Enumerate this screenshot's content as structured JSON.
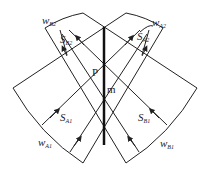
{
  "diagram": {
    "labels": {
      "wB2": {
        "main": "w",
        "sub": "B2"
      },
      "SB2": {
        "main": "S",
        "sub": "B2"
      },
      "wA2": {
        "main": "w",
        "sub": "A2"
      },
      "SA2": {
        "main": "S",
        "sub": "A2"
      },
      "P": "P",
      "m": "m",
      "SA1": {
        "main": "S",
        "sub": "A1"
      },
      "SB1": {
        "main": "S",
        "sub": "B1"
      },
      "wA1": {
        "main": "w",
        "sub": "A1"
      },
      "wB1": {
        "main": "w",
        "sub": "B1"
      }
    },
    "colors": {
      "stroke": "#222222",
      "background": "#ffffff"
    }
  }
}
